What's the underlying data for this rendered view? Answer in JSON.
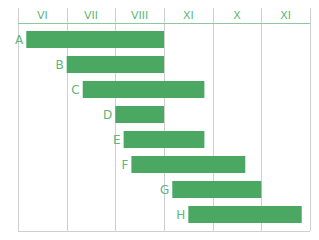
{
  "chart_data": {
    "type": "bar",
    "orientation": "horizontal-gantt",
    "title": "",
    "xlabel": "",
    "ylabel": "",
    "x_tick_labels": [
      "VI",
      "VII",
      "VIII",
      "XI",
      "X",
      "XI"
    ],
    "x_range": [
      0,
      6
    ],
    "x_unit": "months from start of VI",
    "grid": true,
    "legend": "none",
    "categories": [
      "A",
      "B",
      "C",
      "D",
      "E",
      "F",
      "G",
      "H"
    ],
    "series": [
      {
        "name": "tasks",
        "start": [
          0.17,
          1.0,
          1.33,
          2.0,
          2.17,
          2.33,
          3.17,
          3.5
        ],
        "end": [
          3.0,
          3.0,
          3.83,
          3.0,
          3.83,
          4.67,
          5.0,
          5.83
        ]
      }
    ],
    "colors": {
      "bar": "#4aa862",
      "text": "#5fb57a",
      "grid": "#cfcfcf"
    }
  }
}
